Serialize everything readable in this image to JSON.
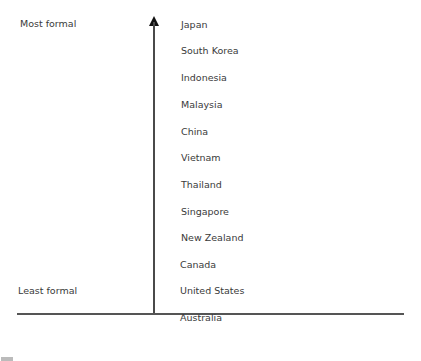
{
  "scale": {
    "top_label": "Most formal",
    "bottom_label": "Least formal"
  },
  "countries": [
    "Japan",
    "South Korea",
    "Indonesia",
    "Malaysia",
    "China",
    "Vietnam",
    "Thailand",
    "Singapore",
    "New Zealand",
    "Canada",
    "United States",
    "Australia"
  ]
}
